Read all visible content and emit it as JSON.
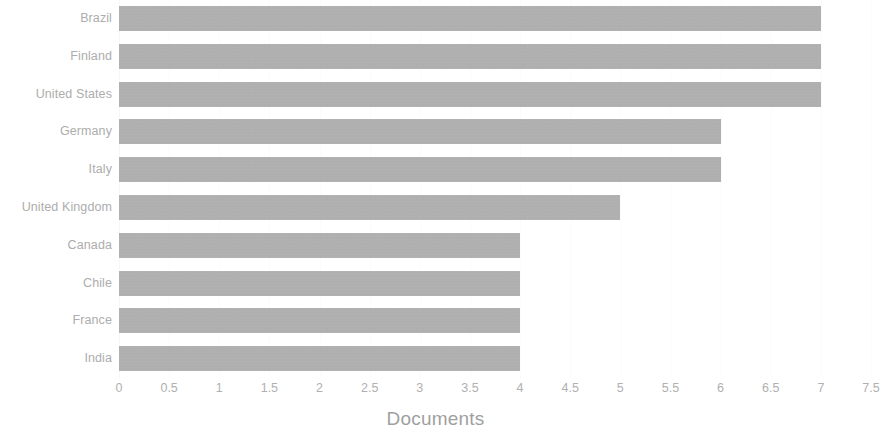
{
  "chart": {
    "type": "bar",
    "orientation": "horizontal",
    "axis_title": "Documents",
    "bar_color": "#a9a9a9",
    "label_color": "#adadad",
    "background_color": "#ffffff"
  },
  "chart_data": {
    "type": "bar",
    "title": "",
    "subtitle": "",
    "orientation": "horizontal",
    "categories": [
      "Brazil",
      "Finland",
      "United States",
      "Germany",
      "Italy",
      "United Kingdom",
      "Canada",
      "Chile",
      "France",
      "India"
    ],
    "values": [
      7,
      7,
      7,
      6,
      6,
      5,
      4,
      4,
      4,
      4
    ],
    "xlabel": "Documents",
    "ylabel": "",
    "xlim": [
      0,
      7.5
    ],
    "xticks": [
      0,
      0.5,
      1,
      1.5,
      2,
      2.5,
      3,
      3.5,
      4,
      4.5,
      5,
      5.5,
      6,
      6.5,
      7,
      7.5
    ],
    "xtick_labels": [
      "0",
      "0.5",
      "1",
      "1.5",
      "2",
      "2.5",
      "3",
      "3.5",
      "4",
      "4.5",
      "5",
      "5.5",
      "6",
      "6.5",
      "7",
      "7.5"
    ],
    "grid": true,
    "grid_axis": "x",
    "legend": false,
    "legend_position": "none",
    "series": [
      {
        "name": "Documents",
        "values": [
          7,
          7,
          7,
          6,
          6,
          5,
          4,
          4,
          4,
          4
        ]
      }
    ]
  }
}
